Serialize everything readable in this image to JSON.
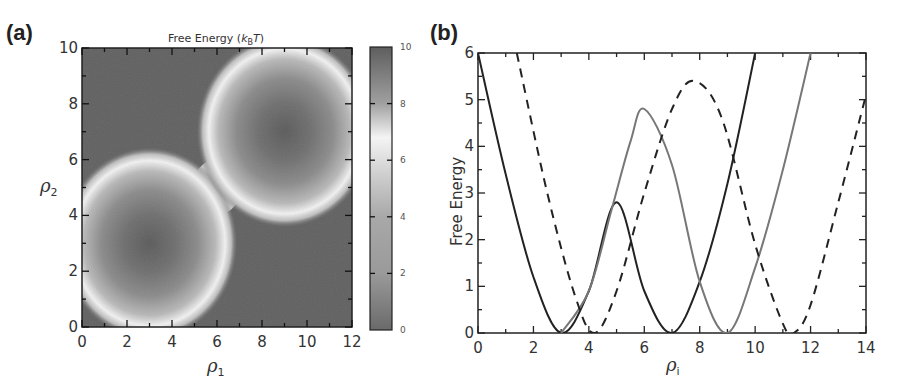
{
  "chart_data": [
    {
      "panel": "(a)",
      "type": "heatmap",
      "title": "Free Energy (kBT)",
      "title_parts": {
        "prefix": "Free Energy (",
        "k": "k",
        "sub": "B",
        "T": "T",
        "suffix": ")"
      },
      "xlabel": "ρ1",
      "ylabel": "ρ2",
      "xlim": [
        0,
        12
      ],
      "ylim": [
        0,
        10
      ],
      "xticks": [
        0,
        2,
        4,
        6,
        8,
        10,
        12
      ],
      "yticks": [
        0,
        2,
        4,
        6,
        8,
        10
      ],
      "colorbar": {
        "min": 0,
        "max": 10,
        "ticks": [
          0,
          2,
          4,
          6,
          8,
          10
        ],
        "label": ""
      },
      "minima": [
        {
          "x": 3,
          "y": 3,
          "value": 0
        },
        {
          "x": 9,
          "y": 7,
          "value": 0
        }
      ],
      "description": "Two circular free-energy wells centered at (3,3) and (9,7) with bright rings (~6-7 kBT) around them; background ~10 kBT",
      "grid": false
    },
    {
      "panel": "(b)",
      "type": "line",
      "title": "",
      "xlabel": "ρi",
      "ylabel": "Free Energy",
      "xlim": [
        0,
        14
      ],
      "ylim": [
        0,
        6
      ],
      "xticks": [
        0,
        2,
        4,
        6,
        8,
        10,
        12,
        14
      ],
      "yticks": [
        0,
        1,
        2,
        3,
        4,
        5,
        6
      ],
      "grid": false,
      "series": [
        {
          "name": "dark solid",
          "style": "solid",
          "color": "#222222",
          "points": [
            [
              0,
              6
            ],
            [
              1,
              3.4
            ],
            [
              2,
              1.2
            ],
            [
              3,
              0
            ],
            [
              4,
              0.9
            ],
            [
              5,
              2.8
            ],
            [
              6,
              0.9
            ],
            [
              7,
              0
            ],
            [
              8,
              1.1
            ],
            [
              9,
              3.2
            ],
            [
              10,
              6
            ]
          ]
        },
        {
          "name": "gray solid",
          "style": "solid",
          "color": "#777777",
          "points": [
            [
              3,
              0
            ],
            [
              4,
              0.9
            ],
            [
              4.8,
              2.6
            ],
            [
              5.5,
              4.1
            ],
            [
              6,
              4.8
            ],
            [
              7,
              3.6
            ],
            [
              8,
              1.1
            ],
            [
              9,
              0
            ],
            [
              10,
              1.4
            ],
            [
              11,
              3.5
            ],
            [
              12,
              6
            ]
          ]
        },
        {
          "name": "dashed",
          "style": "dashed",
          "color": "#222222",
          "points": [
            [
              1.4,
              6
            ],
            [
              2.5,
              3.0
            ],
            [
              3.5,
              0.8
            ],
            [
              4.2,
              0
            ],
            [
              5,
              0.9
            ],
            [
              6,
              3.0
            ],
            [
              7,
              4.8
            ],
            [
              7.8,
              5.4
            ],
            [
              8.8,
              4.6
            ],
            [
              10,
              1.9
            ],
            [
              11,
              0.2
            ],
            [
              11.4,
              0
            ],
            [
              12,
              0.6
            ],
            [
              13,
              2.8
            ],
            [
              14,
              5.1
            ]
          ]
        }
      ]
    }
  ],
  "panels": {
    "a": {
      "label": "(a)",
      "title_prefix": "Free Energy (",
      "title_k": "k",
      "title_sub": "B",
      "title_T": "T",
      "title_suffix": ")",
      "xlabel_base": "ρ",
      "xlabel_sub": "1",
      "ylabel_base": "ρ",
      "ylabel_sub": "2",
      "xtick_labels": [
        "0",
        "2",
        "4",
        "6",
        "8",
        "10",
        "12"
      ],
      "ytick_labels": [
        "0",
        "2",
        "4",
        "6",
        "8",
        "10"
      ],
      "colorbar_labels": [
        "0",
        "2",
        "4",
        "6",
        "8",
        "10"
      ]
    },
    "b": {
      "label": "(b)",
      "ylabel": "Free Energy",
      "xlabel_base": "ρ",
      "xlabel_sub": "i",
      "xtick_labels": [
        "0",
        "2",
        "4",
        "6",
        "8",
        "10",
        "12",
        "14"
      ],
      "ytick_labels": [
        "0",
        "1",
        "2",
        "3",
        "4",
        "5",
        "6"
      ]
    }
  }
}
